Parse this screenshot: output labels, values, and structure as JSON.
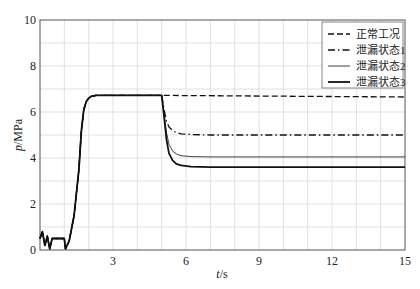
{
  "chart_data": {
    "type": "line",
    "title": "",
    "xlabel_italic": "t",
    "xlabel_unit": "/s",
    "ylabel_italic": "p",
    "ylabel_unit": "/MPa",
    "xlim": [
      0,
      15
    ],
    "ylim": [
      0,
      10
    ],
    "xticks": [
      3,
      6,
      9,
      12,
      15
    ],
    "yticks": [
      0,
      2,
      4,
      6,
      8,
      10
    ],
    "grid": true,
    "grid_x_step": 1,
    "grid_y_step": 1,
    "legend_position": "upper right",
    "series": [
      {
        "name": "正常工况",
        "style": "dashed",
        "width": 1.3,
        "x": [
          0,
          0.1,
          0.2,
          0.3,
          0.4,
          0.5,
          1.0,
          1.05,
          1.2,
          1.4,
          1.6,
          1.7,
          1.8,
          1.9,
          2.0,
          2.1,
          2.3,
          2.6,
          5.0,
          15
        ],
        "y": [
          0.5,
          0.8,
          0.2,
          0.6,
          0.05,
          0.5,
          0.5,
          0.05,
          0.4,
          1.5,
          3.5,
          5.2,
          6.1,
          6.45,
          6.6,
          6.68,
          6.72,
          6.72,
          6.72,
          6.65
        ]
      },
      {
        "name": "泄漏状态1",
        "style": "dashdot",
        "width": 1.3,
        "x": [
          0,
          0.1,
          0.2,
          0.3,
          0.4,
          0.5,
          1.0,
          1.05,
          1.2,
          1.4,
          1.6,
          1.7,
          1.8,
          1.9,
          2.0,
          2.1,
          2.3,
          2.6,
          5.0,
          5.1,
          5.2,
          5.3,
          5.45,
          5.6,
          5.8,
          6.2,
          7,
          15
        ],
        "y": [
          0.5,
          0.8,
          0.2,
          0.6,
          0.05,
          0.5,
          0.5,
          0.05,
          0.4,
          1.5,
          3.5,
          5.2,
          6.1,
          6.45,
          6.6,
          6.68,
          6.72,
          6.72,
          6.72,
          6.1,
          5.6,
          5.35,
          5.2,
          5.1,
          5.05,
          5.02,
          5.0,
          5.0
        ]
      },
      {
        "name": "泄漏状态2",
        "style": "solid",
        "width": 0.8,
        "x": [
          0,
          0.1,
          0.2,
          0.3,
          0.4,
          0.5,
          1.0,
          1.05,
          1.2,
          1.4,
          1.6,
          1.7,
          1.8,
          1.9,
          2.0,
          2.1,
          2.3,
          2.6,
          5.0,
          5.1,
          5.2,
          5.3,
          5.45,
          5.6,
          5.8,
          6.2,
          7,
          15
        ],
        "y": [
          0.5,
          0.8,
          0.2,
          0.6,
          0.05,
          0.5,
          0.5,
          0.05,
          0.4,
          1.5,
          3.5,
          5.2,
          6.1,
          6.45,
          6.6,
          6.68,
          6.72,
          6.72,
          6.72,
          5.9,
          5.1,
          4.6,
          4.3,
          4.18,
          4.1,
          4.06,
          4.05,
          4.05
        ]
      },
      {
        "name": "泄漏状态3",
        "style": "solid",
        "width": 1.8,
        "x": [
          0,
          0.1,
          0.2,
          0.3,
          0.4,
          0.5,
          1.0,
          1.05,
          1.2,
          1.4,
          1.6,
          1.7,
          1.8,
          1.9,
          2.0,
          2.1,
          2.3,
          2.6,
          5.0,
          5.1,
          5.2,
          5.3,
          5.45,
          5.6,
          5.8,
          6.2,
          7,
          15
        ],
        "y": [
          0.5,
          0.8,
          0.2,
          0.6,
          0.05,
          0.5,
          0.5,
          0.05,
          0.4,
          1.5,
          3.5,
          5.2,
          6.1,
          6.45,
          6.6,
          6.68,
          6.72,
          6.72,
          6.72,
          5.8,
          4.8,
          4.2,
          3.9,
          3.75,
          3.68,
          3.62,
          3.6,
          3.6
        ]
      }
    ]
  },
  "colors": {
    "line": "#111111",
    "grid": "#d9d9d9",
    "axis": "#555555"
  }
}
